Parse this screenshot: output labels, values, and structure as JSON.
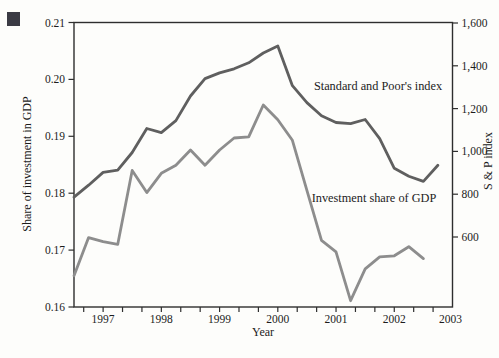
{
  "figure": {
    "bullet_color": "#3b3b44",
    "background": "#fdfdfb",
    "axis_color": "#2e2e2e",
    "text_color": "#1c1c1c"
  },
  "chart_data": {
    "type": "line",
    "title": "",
    "xlabel": "Year",
    "ylabel_left": "Share of investment in GDP",
    "ylabel_right": "S & P index",
    "x_range": [
      1996.5,
      2003
    ],
    "x_year_tick_labels": [
      "1997",
      "1998",
      "1999",
      "2000",
      "2001",
      "2002",
      "2003"
    ],
    "x_year_tick_values": [
      1997,
      1998,
      1999,
      2000,
      2001,
      2002,
      2003
    ],
    "x_minor_tick_start": 1996.6667,
    "x_minor_tick_step": 0.33333,
    "grid": "off",
    "legend_position": "inline-labels",
    "left_axis": {
      "min": 0.16,
      "max": 0.21,
      "tick_values": [
        0.16,
        0.17,
        0.18,
        0.19,
        0.2,
        0.21
      ],
      "tick_labels": [
        "0.16",
        "0.17",
        "0.18",
        "0.19",
        "0.20",
        "0.21"
      ]
    },
    "right_axis": {
      "tick_values": [
        600,
        800,
        1000,
        1200,
        1400,
        1600
      ],
      "tick_labels": [
        "600",
        "800",
        "1,000",
        "1,200",
        "1,400",
        "1,600"
      ],
      "top_value_at_plot_top": 1600,
      "scale_px_per_unit_note": "600 sits above plot bottom; axis bottom ~273"
    },
    "series": [
      {
        "name": "Standard and Poor's index",
        "axis": "right",
        "color": "#5f5f5f",
        "x": [
          1996.5,
          1996.75,
          1997.0,
          1997.25,
          1997.5,
          1997.75,
          1998.0,
          1998.25,
          1998.5,
          1998.75,
          1999.0,
          1999.25,
          1999.5,
          1999.75,
          2000.0,
          2000.25,
          2000.5,
          2000.75,
          2001.0,
          2001.25,
          2001.5,
          2001.75,
          2002.0,
          2002.25,
          2002.5,
          2002.75
        ],
        "values": [
          786,
          842,
          902,
          912,
          995,
          1107,
          1088,
          1144,
          1259,
          1340,
          1367,
          1386,
          1414,
          1460,
          1493,
          1307,
          1228,
          1167,
          1135,
          1130,
          1149,
          1060,
          921,
          884,
          860,
          935
        ]
      },
      {
        "name": "Investment share of GDP",
        "axis": "left",
        "color": "#8d8d8d",
        "x": [
          1996.5,
          1996.75,
          1997.0,
          1997.25,
          1997.5,
          1997.75,
          1998.0,
          1998.25,
          1998.5,
          1998.75,
          1999.0,
          1999.25,
          1999.5,
          1999.75,
          2000.0,
          2000.25,
          2000.5,
          2000.75,
          2001.0,
          2001.25,
          2001.5,
          2001.75,
          2002.0,
          2002.25,
          2002.5
        ],
        "values": [
          0.1655,
          0.1722,
          0.1715,
          0.171,
          0.184,
          0.1801,
          0.1835,
          0.1849,
          0.1876,
          0.1849,
          0.1876,
          0.1897,
          0.1899,
          0.1955,
          0.1929,
          0.1893,
          0.1805,
          0.1717,
          0.1697,
          0.1611,
          0.1667,
          0.1688,
          0.169,
          0.1706,
          0.1685
        ]
      }
    ],
    "annotations": [
      {
        "text": "Standard and Poor's index",
        "x": 378,
        "y": 90
      },
      {
        "text": "Investment share of GDP",
        "x": 374,
        "y": 202
      }
    ]
  }
}
